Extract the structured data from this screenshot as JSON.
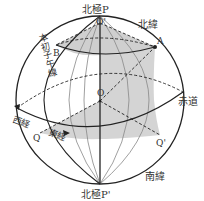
{
  "diagram": {
    "labels": {
      "north_pole": "北極P",
      "south_pole": "北極P'",
      "north_latitude": "北緯",
      "south_latitude": "南緯",
      "equator": "赤道",
      "west_longitude": "西経",
      "east_longitude": "東経",
      "prime_meridian": "本初子午線",
      "point_O": "O",
      "point_O_prime": "O'",
      "point_A": "A",
      "point_B": "B",
      "point_Q": "Q",
      "point_Q_prime": "Q'"
    },
    "colors": {
      "line": "#222222",
      "thin_line": "#888888",
      "shade": "#cfcfcf"
    }
  }
}
